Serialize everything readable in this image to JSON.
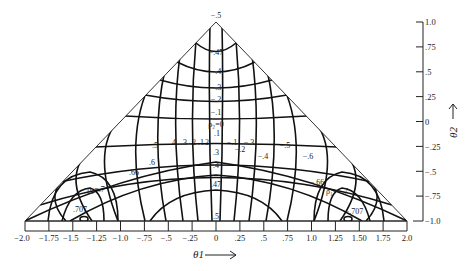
{
  "figure": {
    "apex_label": "−.5",
    "x_axis": {
      "label": "θ1",
      "arrow": "⟶",
      "ticks": [
        "−2.0",
        "−1.75",
        "−1.5",
        "−1.25",
        "−1.0",
        "−.75",
        "−.5",
        "−.25",
        "0",
        ".25",
        ".5",
        ".75",
        "1.0",
        "1.25",
        "1.50",
        "1.75",
        "2.0"
      ],
      "values": [
        -2,
        -1.75,
        -1.5,
        -1.25,
        -1,
        -0.75,
        -0.5,
        -0.25,
        0,
        0.25,
        0.5,
        0.75,
        1,
        1.25,
        1.5,
        1.75,
        2
      ]
    },
    "y_axis": {
      "label": "θ2",
      "arrow": "⟶",
      "ticks": [
        "1.0",
        ".75",
        ".5",
        ".25",
        "0",
        "−.25",
        "−.5",
        "−.75",
        "−1.0"
      ],
      "values": [
        1,
        0.75,
        0.5,
        0.25,
        0,
        -0.25,
        -0.5,
        -0.75,
        -1
      ]
    },
    "contour_labels": {
      "rho2_top": [
        "−.47",
        "−.4",
        "−.3",
        "−.2",
        "−.1"
      ],
      "rho2_zero": "ρ₂=0",
      "rho2_bottom": [
        ".1",
        ".2",
        ".3",
        ".4",
        ".47",
        ".5"
      ],
      "rho1_left": [
        ".1",
        ".2",
        ".3",
        ".4",
        ".5",
        ".6",
        ".66"
      ],
      "rho1_right": [
        "−.1",
        "−.2",
        "−.3",
        "−.4",
        "−.5",
        "−.6",
        "−.66"
      ],
      "rho1_left_named": "ρ₁=.7",
      "rho1_right_named": "ρ₁=−.7",
      "left_peak": ".707",
      "right_peak": "−.707"
    }
  }
}
